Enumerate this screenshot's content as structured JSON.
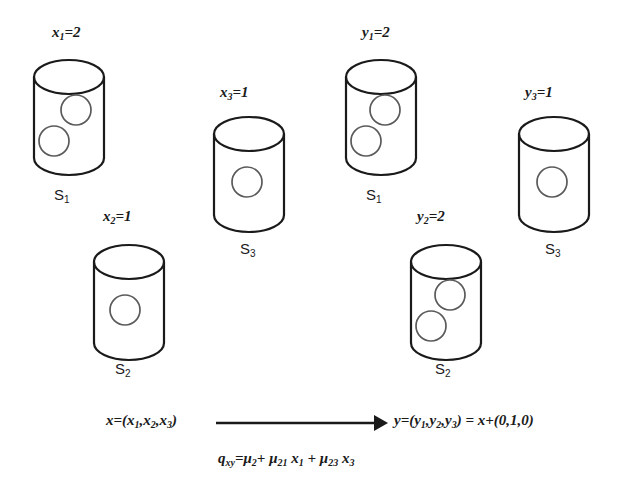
{
  "figure": {
    "stroke_color": "#1a1a1a",
    "ball_stroke_color": "#555555",
    "background": "#ffffff"
  },
  "left_state": {
    "name": "x",
    "bins": [
      {
        "bin_label": "S",
        "bin_index": "1",
        "count_var": "x",
        "count_sub": "1",
        "count_text": "=2",
        "count_label_full": "x1=2",
        "balls": 2
      },
      {
        "bin_label": "S",
        "bin_index": "2",
        "count_var": "x",
        "count_sub": "2",
        "count_text": "=1",
        "count_label_full": "x2=1",
        "balls": 1
      },
      {
        "bin_label": "S",
        "bin_index": "3",
        "count_var": "x",
        "count_sub": "3",
        "count_text": "=1",
        "count_label_full": "x3=1",
        "balls": 1
      }
    ]
  },
  "right_state": {
    "name": "y",
    "bins": [
      {
        "bin_label": "S",
        "bin_index": "1",
        "count_var": "y",
        "count_sub": "1",
        "count_text": "=2",
        "count_label_full": "y1=2",
        "balls": 2
      },
      {
        "bin_label": "S",
        "bin_index": "2",
        "count_var": "y",
        "count_sub": "2",
        "count_text": "=2",
        "count_label_full": "y2=2",
        "balls": 2
      },
      {
        "bin_label": "S",
        "bin_index": "3",
        "count_var": "y",
        "count_sub": "3",
        "count_text": "=1",
        "count_label_full": "y3=1",
        "balls": 1
      }
    ]
  },
  "equations": {
    "left_vector": {
      "head": "x=(x",
      "s1": "1",
      "mid1": ",x",
      "s2": "2",
      "mid2": ",x",
      "s3": "3",
      "tail": ")",
      "full": "x=(x1,x2,x3)"
    },
    "right_vector": {
      "head": "y=(y",
      "s1": "1",
      "mid1": ",y",
      "s2": "2",
      "mid2": ",y",
      "s3": "3",
      "tail": ") = x+(0,1,0)",
      "full": "y=(y1,y2,y3) = x+(0,1,0)"
    },
    "rate": {
      "q": "q",
      "q_sub": "xy",
      "eq1": "=μ",
      "m1_sub": "2",
      "plus1": "+ μ",
      "m2_sub": "21",
      "var1": " x",
      "v1_sub": "1",
      "plus2": " + μ",
      "m3_sub": "23",
      "var2": " x",
      "v2_sub": "3",
      "full": "qxy=μ2+ μ21 x1 + μ23 x3"
    },
    "arrow": {
      "name": "transition-arrow",
      "direction": "right"
    }
  }
}
